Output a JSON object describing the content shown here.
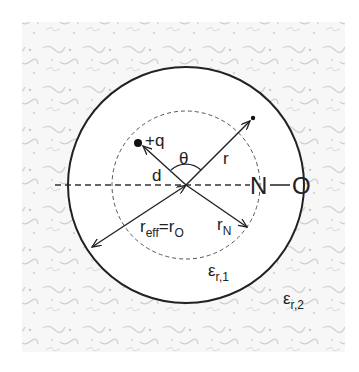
{
  "diagram": {
    "colors": {
      "line": "#222222",
      "dashed": "#444444",
      "background_texture": "#c8c8c8",
      "inner_fill": "#ffffff"
    },
    "geometry": {
      "center": [
        186,
        185
      ],
      "outer_radius": 118,
      "inner_dashed_radius": 74,
      "angle_arc_radius": 22
    },
    "labels": {
      "charge": "+q",
      "theta": "θ",
      "r": "r",
      "d": "d",
      "r_eff_main": "r",
      "r_eff_sub": "eff",
      "r_eff_eq": "=r",
      "r_eff_sub2": "O",
      "r_N_main": "r",
      "r_N_sub": "N",
      "atom_N": "N",
      "bond": "—",
      "atom_O": "O",
      "eps1_main": "ε",
      "eps1_sub": "r,1",
      "eps2_main": "ε",
      "eps2_sub": "r,2"
    },
    "elements": [
      {
        "type": "solid-circle",
        "label": "outer sphere boundary (r_eff = r_O)"
      },
      {
        "type": "dashed-circle",
        "label": "N atom sphere (r_N)"
      },
      {
        "type": "dashed-axis",
        "label": "N-O bond axis"
      },
      {
        "type": "arrow",
        "label": "d",
        "from": "center",
        "to": "+q charge"
      },
      {
        "type": "arrow",
        "label": "r",
        "from": "center",
        "to": "field point"
      },
      {
        "type": "arrow",
        "label": "r_N",
        "from": "center",
        "to": "inner circle"
      },
      {
        "type": "double-arrow",
        "label": "r_eff = r_O",
        "from": "center",
        "to": "outer circle"
      },
      {
        "type": "arc",
        "label": "θ",
        "between": [
          "d",
          "r"
        ]
      }
    ]
  }
}
